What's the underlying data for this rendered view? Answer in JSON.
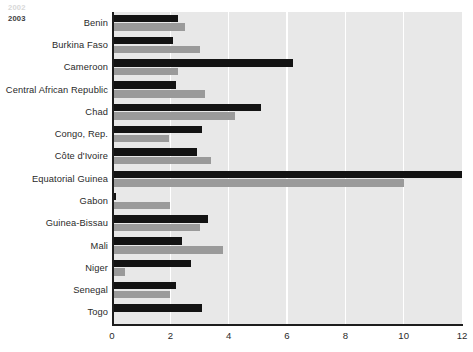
{
  "chart_data": {
    "type": "bar",
    "orientation": "horizontal",
    "title": "",
    "xlabel": "",
    "ylabel": "",
    "xlim": [
      0,
      12
    ],
    "xticks": [
      0,
      2,
      4,
      6,
      8,
      10,
      12
    ],
    "grid": true,
    "legend_position": "top-left-inside",
    "categories": [
      "Benin",
      "Burkina Faso",
      "Cameroon",
      "Central African Republic",
      "Chad",
      "Congo, Rep.",
      "Côte d'Ivoire",
      "Equatorial Guinea",
      "Gabon",
      "Guinea-Bissau",
      "Mali",
      "Niger",
      "Senegal",
      "Togo"
    ],
    "series": [
      {
        "name": "2002",
        "color": "#131313",
        "values": [
          2.25,
          2.1,
          6.2,
          2.2,
          5.1,
          3.1,
          2.9,
          12.0,
          0.15,
          3.3,
          2.4,
          2.7,
          2.2,
          3.1
        ]
      },
      {
        "name": "2003",
        "color": "#9a9a9a",
        "values": [
          2.5,
          3.0,
          2.25,
          3.2,
          4.2,
          1.95,
          3.4,
          10.0,
          2.0,
          3.0,
          3.8,
          0.45,
          2.0,
          0.0
        ]
      }
    ]
  },
  "legend": {
    "items": [
      {
        "label": "2002",
        "color": "#131313"
      },
      {
        "label": "2003",
        "color": "#9a9a9a"
      }
    ]
  },
  "axis": {
    "tick_labels": [
      "0",
      "2",
      "4",
      "6",
      "8",
      "10",
      "12"
    ]
  }
}
